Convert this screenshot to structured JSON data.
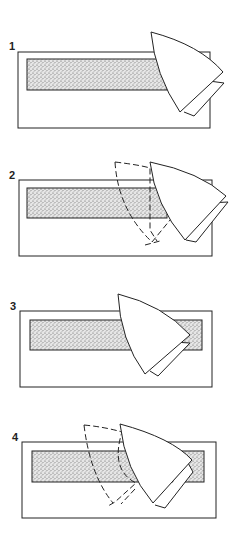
{
  "diagram": {
    "type": "step-sequence illustration",
    "panels": [
      {
        "label": "1",
        "description": "Iron shape at right end of stippled bar"
      },
      {
        "label": "2",
        "description": "Iron shape with dashed previous position, moving along bar"
      },
      {
        "label": "3",
        "description": "Iron shape over middle-right of bar"
      },
      {
        "label": "4",
        "description": "Iron shape with dashed previous position further along"
      }
    ],
    "colors": {
      "stroke": "#222222",
      "stipple": "#9a9a9a",
      "background": "#ffffff"
    }
  }
}
